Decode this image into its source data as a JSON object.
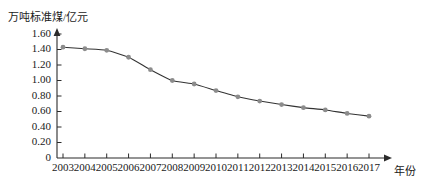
{
  "chart_data": {
    "type": "line",
    "title": "",
    "subtitle": "",
    "ylabel": "万吨标准煤/亿元",
    "xlabel": "年份",
    "categories": [
      "2003",
      "2004",
      "2005",
      "2006",
      "2007",
      "2008",
      "2009",
      "2010",
      "2011",
      "2012",
      "2013",
      "2014",
      "2015",
      "2016",
      "2017"
    ],
    "x": [
      2003,
      2004,
      2005,
      2006,
      2007,
      2008,
      2009,
      2010,
      2011,
      2012,
      2013,
      2014,
      2015,
      2016,
      2017
    ],
    "values": [
      1.43,
      1.41,
      1.39,
      1.3,
      1.14,
      1.0,
      0.955,
      0.87,
      0.79,
      0.735,
      0.69,
      0.65,
      0.62,
      0.575,
      0.54
    ],
    "series": [
      {
        "name": "万吨标准煤/亿元",
        "values": [
          1.43,
          1.41,
          1.39,
          1.3,
          1.14,
          1.0,
          0.955,
          0.87,
          0.79,
          0.735,
          0.69,
          0.65,
          0.62,
          0.575,
          0.54
        ]
      }
    ],
    "ylim": [
      0,
      1.6
    ],
    "xlim": [
      2003,
      2017
    ],
    "yticks": [
      "0",
      "0.20",
      "0.40",
      "0.60",
      "0.80",
      "1.00",
      "1.20",
      "1.40",
      "1.60"
    ],
    "ytick_values": [
      0,
      0.2,
      0.4,
      0.6,
      0.8,
      1.0,
      1.2,
      1.4,
      1.6
    ],
    "grid": false,
    "legend": false,
    "legend_position": "none",
    "marker": "circle",
    "line_color": "#333333",
    "marker_color": "#8c8c8c",
    "axis_color": "#2b2b2b",
    "background_color": "#ffffff"
  }
}
